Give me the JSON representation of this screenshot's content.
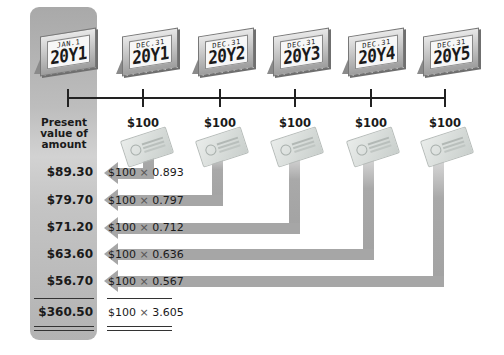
{
  "diagram": {
    "colors": {
      "panel": "#b8b8b8",
      "arrow": "#a6a6a6",
      "line": "#222222",
      "text": "#1a1a1a"
    }
  },
  "calendars": [
    {
      "month": "JAN.1",
      "year": "20Y1"
    },
    {
      "month": "DEC.31",
      "year": "20Y1"
    },
    {
      "month": "DEC.31",
      "year": "20Y2"
    },
    {
      "month": "DEC.31",
      "year": "20Y3"
    },
    {
      "month": "DEC.31",
      "year": "20Y4"
    },
    {
      "month": "DEC.31",
      "year": "20Y5"
    }
  ],
  "pv_header": "Present value of amount",
  "payments": [
    "$100",
    "$100",
    "$100",
    "$100",
    "$100"
  ],
  "rows": [
    {
      "present_value": "$89.30",
      "formula_amount": "$100",
      "operator": "×",
      "factor": "0.893"
    },
    {
      "present_value": "$79.70",
      "formula_amount": "$100",
      "operator": "×",
      "factor": "0.797"
    },
    {
      "present_value": "$71.20",
      "formula_amount": "$100",
      "operator": "×",
      "factor": "0.712"
    },
    {
      "present_value": "$63.60",
      "formula_amount": "$100",
      "operator": "×",
      "factor": "0.636"
    },
    {
      "present_value": "$56.70",
      "formula_amount": "$100",
      "operator": "×",
      "factor": "0.567"
    }
  ],
  "total": {
    "present_value": "$360.50",
    "formula_amount": "$100",
    "operator": "×",
    "factor": "3.605"
  },
  "icons": {
    "calendar": "desk-calendar-icon",
    "check": "bank-check-icon",
    "arrow": "left-arrow"
  }
}
